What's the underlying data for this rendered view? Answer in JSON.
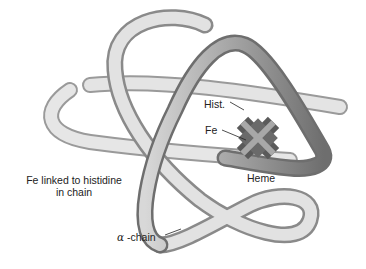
{
  "diagram": {
    "labels": {
      "hist": "Hist.",
      "fe": "Fe",
      "heme": "Heme",
      "caption_line1": "Fe linked to histidine",
      "caption_line2": "in chain",
      "alpha_symbol": "α",
      "chain": " -chain"
    },
    "colors": {
      "tube_light": "#ececec",
      "tube_mid": "#c8c8c8",
      "tube_dark": "#7a7a7a",
      "heme_dark": "#5a5a5a",
      "heme_light": "#a8a8a8",
      "text": "#222222"
    }
  }
}
